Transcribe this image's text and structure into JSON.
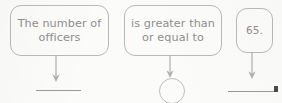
{
  "worksheet": {
    "background_color": "#fbfbfa",
    "outline_color": "#b9b9b9",
    "text_color": "#8e8e8e",
    "blank_color": "#999999",
    "boxes": [
      {
        "id": "subject",
        "line1": "The number of",
        "line2": "officers"
      },
      {
        "id": "comparison",
        "line1": "is greater than",
        "line2": "or equal to"
      },
      {
        "id": "value",
        "line1": "65.",
        "line2": ""
      }
    ],
    "arrows": [
      {
        "id": "arrow-subject",
        "direction": "down"
      },
      {
        "id": "arrow-comparison",
        "direction": "down"
      },
      {
        "id": "arrow-value",
        "direction": "down"
      }
    ],
    "answer_slots": [
      {
        "id": "slot-variable",
        "shape": "blank-line"
      },
      {
        "id": "slot-operator",
        "shape": "circle"
      },
      {
        "id": "slot-number",
        "shape": "blank-line"
      }
    ]
  }
}
